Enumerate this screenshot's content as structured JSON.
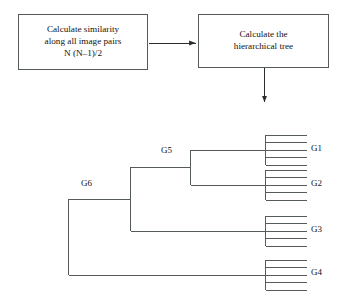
{
  "diagram": {
    "stroke_color": "#555a5c",
    "text_color": "#14120f",
    "background": "#ffffff"
  },
  "flow": {
    "boxes": [
      {
        "id": "similarity",
        "lines": [
          "Calculate similarity",
          "along all image pairs",
          "N (N–1)/2"
        ]
      },
      {
        "id": "tree",
        "lines": [
          "Calculate the",
          "hierarchical tree"
        ]
      }
    ],
    "connectors": [
      {
        "id": "box1-to-box2",
        "orientation": "horizontal",
        "arrowhead": "right"
      },
      {
        "id": "box2-to-dendrogram",
        "orientation": "vertical",
        "arrowhead": "down"
      }
    ]
  },
  "dendrogram": {
    "leaf_groups": [
      {
        "label": "G1",
        "member_lines": 5
      },
      {
        "label": "G2",
        "member_lines": 5
      },
      {
        "label": "G3",
        "member_lines": 5
      },
      {
        "label": "G4",
        "member_lines": 5
      }
    ],
    "internal_nodes": [
      {
        "label": "G5",
        "children": [
          "G1",
          "G2"
        ]
      },
      {
        "label": "G6",
        "children": [
          "G5",
          "G3"
        ]
      }
    ],
    "root_children": [
      "G6",
      "G4"
    ]
  }
}
